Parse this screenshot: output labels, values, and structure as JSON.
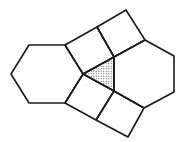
{
  "diagram": {
    "stroke_color": "#1a1a1a",
    "fill_color": "#ffffff",
    "shade_color": "#555555",
    "stroke_width": 1.6,
    "shapes": {
      "left_hexagon": "29,45 65,45 83,74 65,103 29,103 11,74",
      "right_hexagon": "114,57 145,40 174,56 174,92 144,108 114,91",
      "top_left_square": "65,45 97,27 114,57 83,74",
      "top_right_square": "97,27 126,10 145,40 114,57",
      "bottom_left_square": "65,103 83,74 114,91 96,120",
      "bottom_right_square": "96,120 114,91 144,108 128,137",
      "center_triangle": "83,74 114,57 114,91"
    }
  }
}
